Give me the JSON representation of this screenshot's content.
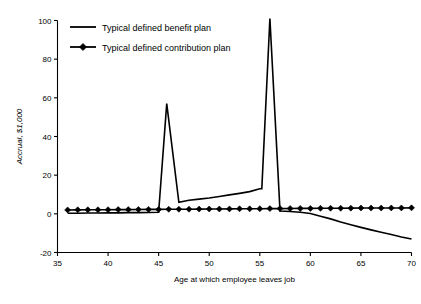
{
  "chart_data": {
    "type": "line",
    "title": "",
    "xlabel": "Age at which employee  leaves job",
    "ylabel": "Accrual, $1,000",
    "xlim": [
      35,
      70
    ],
    "ylim": [
      -20,
      100
    ],
    "xticks": [
      35,
      40,
      45,
      50,
      55,
      60,
      65,
      70
    ],
    "xticklabels": [
      "35",
      "40",
      "45",
      "50",
      "55",
      "60",
      "65",
      "70"
    ],
    "yticks": [
      -20,
      0,
      20,
      40,
      60,
      80,
      100
    ],
    "yticklabels": [
      "-20",
      "0",
      "20",
      "40",
      "60",
      "80",
      "100"
    ],
    "grid": false,
    "legend_position": "upper-left-inside",
    "series": [
      {
        "name": "Typical defined benefit plan",
        "marker": "none",
        "color": "#000000",
        "x": [
          36,
          37,
          38,
          39,
          40,
          41,
          42,
          43,
          44,
          45,
          45.8,
          47,
          48,
          49,
          50,
          51,
          52,
          53,
          54,
          55,
          55.2,
          56,
          57,
          58,
          59,
          60,
          61,
          62,
          63,
          64,
          65,
          66,
          67,
          68,
          69,
          70
        ],
        "values": [
          0.3,
          0.3,
          0.4,
          0.4,
          0.5,
          0.5,
          0.6,
          0.6,
          0.7,
          0.8,
          57,
          6,
          7,
          7.6,
          8.2,
          9,
          9.8,
          10.6,
          11.5,
          13,
          13,
          101,
          1.5,
          1.2,
          0.8,
          0.2,
          -1.2,
          -2.6,
          -4.2,
          -5.6,
          -7,
          -8.3,
          -9.5,
          -10.7,
          -12,
          -13
        ]
      },
      {
        "name": "Typical defined contribution plan",
        "marker": "diamond",
        "color": "#000000",
        "x": [
          36,
          37,
          38,
          39,
          40,
          41,
          42,
          43,
          44,
          45,
          46,
          47,
          48,
          49,
          50,
          51,
          52,
          53,
          54,
          55,
          56,
          57,
          58,
          59,
          60,
          61,
          62,
          63,
          64,
          65,
          66,
          67,
          68,
          69,
          70
        ],
        "values": [
          2.0,
          2.05,
          2.1,
          2.1,
          2.15,
          2.2,
          2.2,
          2.25,
          2.3,
          2.3,
          2.35,
          2.4,
          2.4,
          2.45,
          2.5,
          2.5,
          2.55,
          2.6,
          2.6,
          2.65,
          2.7,
          2.7,
          2.75,
          2.8,
          2.8,
          2.85,
          2.9,
          2.9,
          2.95,
          3.0,
          3.0,
          3.0,
          3.05,
          3.05,
          3.1
        ]
      }
    ]
  },
  "legend": {
    "items": [
      {
        "label": "Typical defined benefit plan",
        "marker": "line"
      },
      {
        "label": "Typical defined contribution plan",
        "marker": "line-diamond"
      }
    ]
  }
}
